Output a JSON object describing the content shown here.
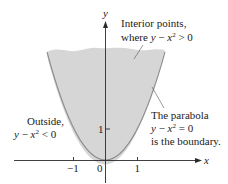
{
  "figure": {
    "colors": {
      "region_fill": "#d6d6d6",
      "boundary_stroke": "#8c8c8c",
      "axis": "#2a2a2a",
      "text": "#222222"
    },
    "axes": {
      "x_label": "x",
      "y_label": "y",
      "x_ticks": [
        {
          "value": -1,
          "label": "−1"
        },
        {
          "value": 0,
          "label": "0"
        },
        {
          "value": 1,
          "label": "1"
        }
      ],
      "y_ticks": [
        {
          "value": 1,
          "label": "1"
        }
      ]
    },
    "annotations": {
      "interior": {
        "line1": "Interior points,",
        "line2_prefix": "where ",
        "line2_var_y": "y",
        "line2_minus": " − ",
        "line2_var_x": "x",
        "line2_exp": "2",
        "line2_rel": " > 0"
      },
      "outside": {
        "line1": "Outside,",
        "line2_var_y": "y",
        "line2_minus": " − ",
        "line2_var_x": "x",
        "line2_exp": "2",
        "line2_rel": " < 0"
      },
      "boundary": {
        "line1": "The parabola",
        "line2_var_y": "y",
        "line2_minus": " − ",
        "line2_var_x": "x",
        "line2_exp": "2",
        "line2_rel": " = 0",
        "line3": "is the boundary."
      }
    }
  }
}
